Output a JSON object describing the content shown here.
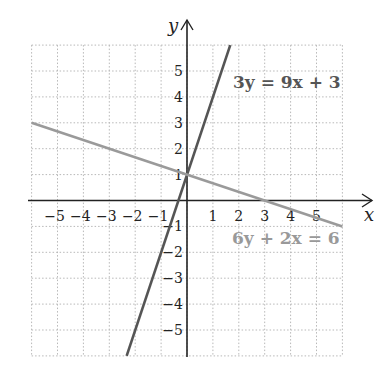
{
  "chart_data": {
    "type": "line",
    "title": "",
    "xlabel": "x",
    "ylabel": "y",
    "xlim": [
      -6,
      6
    ],
    "ylim": [
      -6,
      6
    ],
    "grid": true,
    "grid_style": "dotted",
    "x_ticks": [
      "−5",
      "−4",
      "−3",
      "−2",
      "−1",
      "1",
      "2",
      "3",
      "4",
      "5"
    ],
    "y_ticks": [
      "5",
      "4",
      "3",
      "2",
      "1",
      "−1",
      "−2",
      "−3",
      "−4",
      "−5"
    ],
    "series": [
      {
        "name": "3y = 9x + 3",
        "equation": "y = 3x + 1",
        "slope": 3,
        "intercept": 1,
        "x": [
          -2.33,
          1.67
        ],
        "y": [
          -6,
          6
        ],
        "color": "#555555"
      },
      {
        "name": "6y + 2x = 6",
        "equation": "y = -x/3 + 1",
        "slope": -0.3333,
        "intercept": 1,
        "x": [
          -6,
          6
        ],
        "y": [
          3,
          -1
        ],
        "color": "#999999"
      }
    ],
    "annotations": [
      {
        "text": "3y = 9x + 3",
        "x": 2,
        "y": 4.5
      },
      {
        "text": "6y + 2x = 6",
        "x": 3.2,
        "y": -1.5
      }
    ]
  },
  "labels": {
    "x_axis": "x",
    "y_axis": "y",
    "eq1": "3y = 9x + 3",
    "eq2": "6y + 2x = 6"
  },
  "colors": {
    "line1": "#555555",
    "line2": "#9a9a9a",
    "grid": "#b8b8b8",
    "axis": "#222222"
  }
}
